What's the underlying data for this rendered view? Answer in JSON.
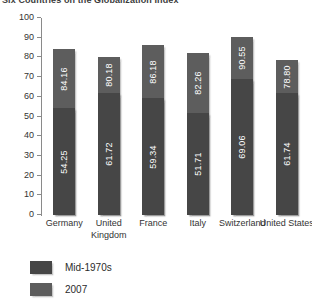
{
  "chart_data": {
    "type": "bar",
    "title": "Six Countries on the Globalization Index",
    "xlabel": "",
    "ylabel": "",
    "ylim": [
      0,
      100
    ],
    "yticks": [
      100,
      90,
      80,
      70,
      60,
      50,
      40,
      30,
      20,
      10,
      0
    ],
    "grid": false,
    "legend_position": "bottom-left",
    "stacked_overlap": true,
    "categories": [
      "Germany",
      "United Kingdom",
      "France",
      "Italy",
      "Switzerland",
      "United States"
    ],
    "series": [
      {
        "name": "Mid-1970s",
        "color": "#464646",
        "values": [
          54.25,
          61.72,
          59.34,
          51.71,
          69.06,
          61.74
        ],
        "labels": [
          "54.25",
          "61.72",
          "59.34",
          "51.71",
          "69.06",
          "61.74"
        ]
      },
      {
        "name": "2007",
        "color": "#5d5d5d",
        "values": [
          84.16,
          80.18,
          86.18,
          82.26,
          90.55,
          78.8
        ],
        "labels": [
          "84.16",
          "80.18",
          "86.18",
          "82.26",
          "90.55",
          "78.80"
        ]
      }
    ]
  },
  "legend": {
    "items": [
      {
        "label": "Mid-1970s",
        "color": "#464646"
      },
      {
        "label": "2007",
        "color": "#5d5d5d"
      }
    ]
  }
}
